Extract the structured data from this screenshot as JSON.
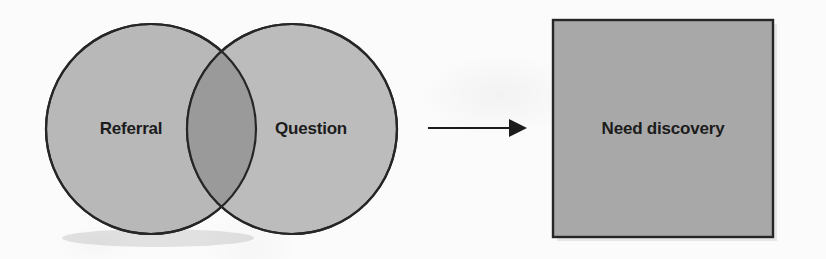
{
  "diagram": {
    "background_color": "#fbfbfb",
    "venn": {
      "left_circle": {
        "label": "Referral",
        "fill": "#b8b8b8",
        "stroke": "#262626",
        "cx": 151,
        "cy": 129,
        "r": 105
      },
      "right_circle": {
        "label": "Question",
        "fill": "#bcbcbc",
        "stroke": "#262626",
        "cx": 292,
        "cy": 129,
        "r": 105
      },
      "intersection": {
        "label": "",
        "fill": "#9a9a9a"
      }
    },
    "arrow": {
      "name": "leads-to-arrow",
      "direction": "right",
      "color": "#1c1c1c",
      "x_start": 428,
      "x_end": 527,
      "y": 128
    },
    "result_box": {
      "label": "Need discovery",
      "fill": "#a8a8a8",
      "stroke": "#262626",
      "x": 553,
      "y": 20,
      "width": 220,
      "height": 217
    }
  }
}
